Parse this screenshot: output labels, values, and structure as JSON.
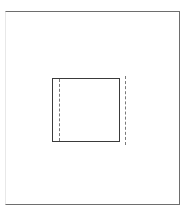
{
  "figure": {
    "background_color": "#ffffff",
    "width": 193,
    "height": 218
  },
  "outer_frame": {
    "name": "outer border frame",
    "stroke_color": "#6e6e6e",
    "left_edge_color": "#e8e8e8",
    "x": 5,
    "y": 11,
    "width": 175,
    "height": 194,
    "line_style": "solid",
    "line_width": 1,
    "fill": "none"
  },
  "inner_square": {
    "name": "inner square outline",
    "stroke_color": "#3a3a3a",
    "x": 52,
    "y": 78,
    "width": 68,
    "height": 64,
    "line_style": "solid",
    "line_width": 1,
    "fill": "none"
  },
  "construction_lines": [
    {
      "name": "left dashed construction line",
      "orientation": "vertical",
      "position": "inside left edge of inner square",
      "x": 59,
      "y": 79,
      "length": 62,
      "stroke_color": "#7a7a7a",
      "line_style": "dashed",
      "dash_length": 4,
      "gap_length": 3,
      "line_width": 1
    },
    {
      "name": "right dashed construction line",
      "orientation": "vertical",
      "position": "outside right edge of inner square",
      "x": 125,
      "y": 76,
      "length": 69,
      "stroke_color": "#7a7a7a",
      "line_style": "dashed",
      "dash_length": 4,
      "gap_length": 3,
      "line_width": 1
    }
  ]
}
